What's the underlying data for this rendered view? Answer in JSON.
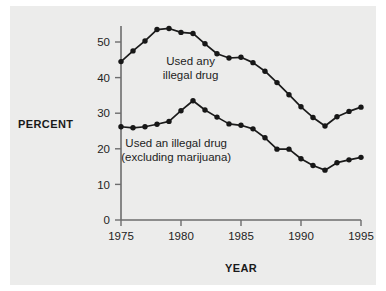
{
  "chart_data": {
    "type": "line",
    "title": "",
    "xlabel": "YEAR",
    "ylabel": "PERCENT",
    "x": [
      1975,
      1976,
      1977,
      1978,
      1979,
      1980,
      1981,
      1982,
      1983,
      1984,
      1985,
      1986,
      1987,
      1988,
      1989,
      1990,
      1991,
      1992,
      1993,
      1994,
      1995
    ],
    "xlim": [
      1975,
      1995
    ],
    "ylim": [
      0,
      55
    ],
    "xticks": [
      1975,
      1980,
      1985,
      1990,
      1995
    ],
    "xtick_labels": [
      "1975",
      "1980",
      "1985",
      "1990",
      "1995"
    ],
    "yticks": [
      0,
      10,
      20,
      30,
      40,
      50
    ],
    "ytick_labels": [
      "0",
      "10",
      "20",
      "30",
      "40",
      "50"
    ],
    "grid": false,
    "legend_position": "inline-annotation",
    "markers": "filled-circle",
    "series": [
      {
        "name": "Used any illegal drug",
        "label_lines": [
          "Used any",
          "illegal drug"
        ],
        "color": "#171717",
        "values": [
          44.5,
          47.5,
          50.3,
          53.5,
          53.8,
          52.7,
          52.4,
          49.5,
          46.7,
          45.5,
          45.7,
          44.2,
          41.8,
          38.6,
          35.2,
          31.8,
          28.8,
          26.4,
          29.0,
          30.5,
          31.7
        ]
      },
      {
        "name": "Used an illegal drug (excluding marijuana)",
        "label_lines": [
          "Used an illegal drug",
          "(excluding marijuana)"
        ],
        "color": "#171717",
        "values": [
          26.2,
          25.9,
          26.2,
          26.9,
          27.7,
          30.7,
          33.5,
          30.9,
          28.9,
          27.0,
          26.6,
          25.6,
          23.1,
          19.9,
          19.9,
          17.2,
          15.3,
          14.0,
          16.1,
          16.9,
          17.6
        ]
      }
    ]
  },
  "canvas": {
    "background_color": "#ffffff",
    "plate_color": "#ececeb",
    "axis_color": "#6d6d6d",
    "ink_color": "#171717"
  },
  "annotations": {
    "upper_label_x": 1980.8,
    "upper_label_y": 43.5,
    "lower_label_x": 1979.6,
    "lower_label_y": 20.5
  }
}
